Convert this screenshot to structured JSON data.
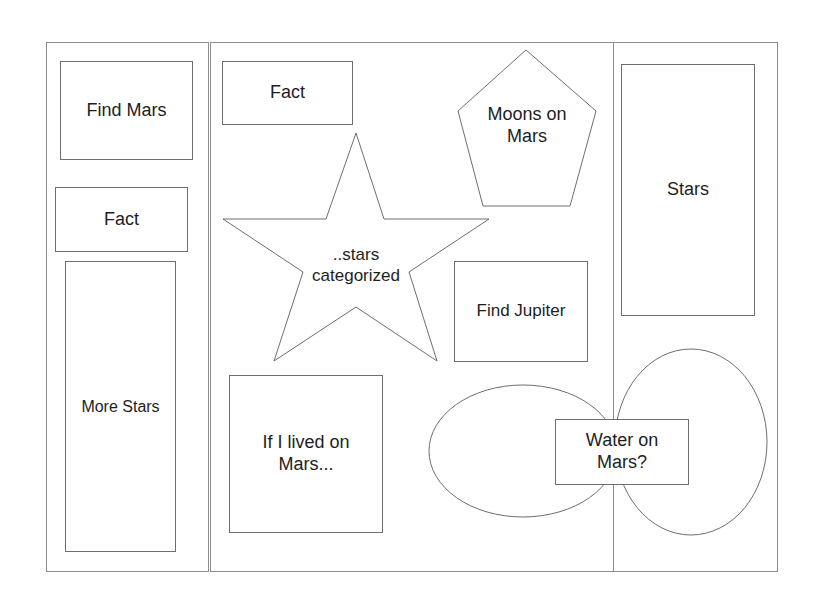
{
  "diagram": {
    "title": "",
    "style": {
      "line_color": "#8c8c8c",
      "shape_stroke": "#6e6e6e",
      "text_color": "#1e1e1e",
      "background": "#ffffff"
    },
    "panels": [
      {
        "id": "left",
        "label": ""
      },
      {
        "id": "middle",
        "label": ""
      },
      {
        "id": "right",
        "label": ""
      }
    ],
    "left_panel": {
      "find_mars": "Find Mars",
      "fact": "Fact",
      "more_stars": "More Stars"
    },
    "middle_panel": {
      "fact": "Fact",
      "moons_on_mars": "Moons on\nMars",
      "stars_categorized": "..stars\ncategorized",
      "find_jupiter": "Find Jupiter",
      "if_i_lived_on_mars": "If I lived on\nMars..."
    },
    "right_panel": {
      "stars": "Stars"
    },
    "bottom_right": {
      "water_on_mars": "Water on\nMars?"
    },
    "shapes": [
      {
        "type": "rectangle",
        "text": "Find Mars"
      },
      {
        "type": "rectangle",
        "text": "Fact"
      },
      {
        "type": "rectangle",
        "text": "More Stars"
      },
      {
        "type": "rectangle",
        "text": "Fact"
      },
      {
        "type": "pentagon",
        "text": "Moons on Mars"
      },
      {
        "type": "star",
        "text": "..stars categorized"
      },
      {
        "type": "rectangle",
        "text": "Find Jupiter"
      },
      {
        "type": "rectangle",
        "text": "If I lived on Mars..."
      },
      {
        "type": "rectangle",
        "text": "Stars"
      },
      {
        "type": "ellipse",
        "text": ""
      },
      {
        "type": "ellipse",
        "text": ""
      },
      {
        "type": "rectangle",
        "text": "Water on Mars?"
      }
    ]
  }
}
